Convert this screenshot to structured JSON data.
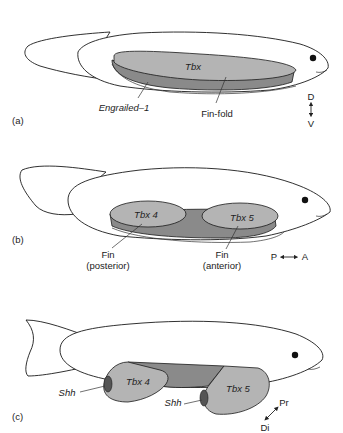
{
  "panels": [
    {
      "id": "a",
      "label": "(a)",
      "domains": [
        {
          "name": "Tbx",
          "italic": true
        },
        {
          "name": "Engrailed–1",
          "italic": true
        }
      ],
      "callouts": [
        "Engrailed–1",
        "Fin-fold"
      ],
      "axis": {
        "top": "D",
        "bottom": "V",
        "icon": "vertical-double-arrow"
      }
    },
    {
      "id": "b",
      "label": "(b)",
      "domains": [
        {
          "name": "Tbx 4",
          "italic": true
        },
        {
          "name": "Tbx 5",
          "italic": true
        }
      ],
      "callouts": [
        {
          "line1": "Fin",
          "line2": "(posterior)"
        },
        {
          "line1": "Fin",
          "line2": "(anterior)"
        }
      ],
      "axis": {
        "left": "P",
        "right": "A",
        "icon": "horizontal-double-arrow"
      }
    },
    {
      "id": "c",
      "label": "(c)",
      "domains": [
        {
          "name": "Tbx 4",
          "italic": true
        },
        {
          "name": "Tbx 5",
          "italic": true
        }
      ],
      "callouts": [
        "Shh",
        "Shh"
      ],
      "axis": {
        "top": "Pr",
        "bottom": "Di",
        "icon": "diagonal-double-arrow"
      }
    }
  ],
  "colors": {
    "light_domain": "#b4b4b4",
    "dark_domain": "#8a8a8a",
    "outline": "#1a1a1a",
    "background": "#ffffff"
  }
}
